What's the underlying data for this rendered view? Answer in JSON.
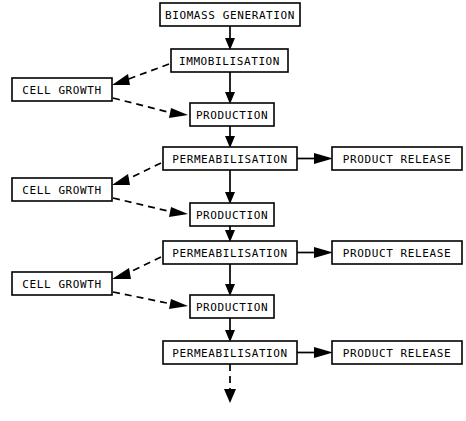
{
  "diagram": {
    "background_color": "#ffffff",
    "line_color": "#000000",
    "nodes": [
      {
        "id": "biomass",
        "label": "BIOMASS GENERATION",
        "x": 160,
        "y": 3,
        "w": 140,
        "h": 23
      },
      {
        "id": "immobilisation",
        "label": "IMMOBILISATION",
        "x": 171,
        "y": 49,
        "w": 117,
        "h": 23
      },
      {
        "id": "cellgrowth1",
        "label": "CELL GROWTH",
        "x": 12,
        "y": 78,
        "w": 100,
        "h": 23
      },
      {
        "id": "production1",
        "label": "PRODUCTION",
        "x": 190,
        "y": 103,
        "w": 84,
        "h": 23
      },
      {
        "id": "permeab1",
        "label": "PERMEABILISATION",
        "x": 163,
        "y": 147,
        "w": 134,
        "h": 23
      },
      {
        "id": "release1",
        "label": "PRODUCT RELEASE",
        "x": 332,
        "y": 147,
        "w": 130,
        "h": 23
      },
      {
        "id": "cellgrowth2",
        "label": "CELL GROWTH",
        "x": 12,
        "y": 178,
        "w": 100,
        "h": 23
      },
      {
        "id": "production2",
        "label": "PRODUCTION",
        "x": 190,
        "y": 203,
        "w": 84,
        "h": 23
      },
      {
        "id": "permeab2",
        "label": "PERMEABILISATION",
        "x": 163,
        "y": 241,
        "w": 134,
        "h": 23
      },
      {
        "id": "release2",
        "label": "PRODUCT RELEASE",
        "x": 332,
        "y": 241,
        "w": 130,
        "h": 23
      },
      {
        "id": "cellgrowth3",
        "label": "CELL GROWTH",
        "x": 12,
        "y": 272,
        "w": 100,
        "h": 23
      },
      {
        "id": "production3",
        "label": "PRODUCTION",
        "x": 190,
        "y": 295,
        "w": 84,
        "h": 23
      },
      {
        "id": "permeab3",
        "label": "PERMEABILISATION",
        "x": 163,
        "y": 341,
        "w": 134,
        "h": 23
      }
    ],
    "edges": [
      {
        "id": "e-biomass-immob",
        "from": "biomass",
        "to": "immobilisation",
        "style": "solid",
        "kind": "vertical"
      },
      {
        "id": "e-immob-cellgrowth1",
        "from": "immobilisation",
        "to": "cellgrowth1",
        "style": "dashed",
        "kind": "diagonal-left"
      },
      {
        "id": "e-cellgrowth1-prod1",
        "from": "cellgrowth1",
        "to": "production1",
        "style": "dashed",
        "kind": "diagonal-right"
      },
      {
        "id": "e-immob-prod1",
        "from": "immobilisation",
        "to": "production1",
        "style": "solid",
        "kind": "vertical"
      },
      {
        "id": "e-prod1-permeab1",
        "from": "production1",
        "to": "permeab1",
        "style": "solid",
        "kind": "vertical"
      },
      {
        "id": "e-permeab1-release1",
        "from": "permeab1",
        "to": "release1",
        "style": "solid",
        "kind": "horizontal"
      },
      {
        "id": "e-permeab1-cellgrowth2",
        "from": "permeab1",
        "to": "cellgrowth2",
        "style": "dashed",
        "kind": "diagonal-left"
      },
      {
        "id": "e-cellgrowth2-prod2",
        "from": "cellgrowth2",
        "to": "production2",
        "style": "dashed",
        "kind": "diagonal-right"
      },
      {
        "id": "e-permeab1-prod2",
        "from": "permeab1",
        "to": "production2",
        "style": "solid",
        "kind": "vertical"
      },
      {
        "id": "e-prod2-permeab2",
        "from": "production2",
        "to": "permeab2",
        "style": "solid",
        "kind": "vertical"
      },
      {
        "id": "e-permeab2-release2",
        "from": "permeab2",
        "to": "release2",
        "style": "solid",
        "kind": "horizontal"
      },
      {
        "id": "e-permeab2-cellgrowth3",
        "from": "permeab2",
        "to": "cellgrowth3",
        "style": "dashed",
        "kind": "diagonal-left"
      },
      {
        "id": "e-cellgrowth3-prod3",
        "from": "cellgrowth3",
        "to": "production3",
        "style": "dashed",
        "kind": "diagonal-right"
      },
      {
        "id": "e-permeab2-prod3",
        "from": "permeab2",
        "to": "production3",
        "style": "solid",
        "kind": "vertical"
      },
      {
        "id": "e-prod3-permeab3",
        "from": "production3",
        "to": "permeab3",
        "style": "solid",
        "kind": "vertical"
      },
      {
        "id": "e-permeab3-release3",
        "from": "permeab3",
        "to": "release3",
        "style": "solid",
        "kind": "horizontal"
      },
      {
        "id": "e-permeab3-continue",
        "from": "permeab3",
        "to": "continuation",
        "style": "dashed",
        "kind": "vertical"
      }
    ],
    "labels": {
      "biomass_generation": "BIOMASS GENERATION",
      "immobilisation": "IMMOBILISATION",
      "cell_growth": "CELL GROWTH",
      "production": "PRODUCTION",
      "permeabilisation": "PERMEABILISATION",
      "product_release": "PRODUCT RELEASE"
    }
  }
}
